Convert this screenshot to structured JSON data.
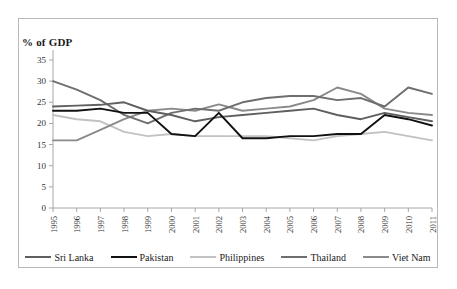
{
  "chart_data": {
    "type": "line",
    "title": "% of GDP",
    "xlabel": "",
    "ylabel": "",
    "ylim": [
      0,
      35
    ],
    "ytick_step": 5,
    "yticks": [
      "35",
      "30",
      "25",
      "20",
      "15",
      "10",
      "5",
      "0"
    ],
    "grid": false,
    "legend_position": "bottom",
    "categories": [
      "1995",
      "1996",
      "1997",
      "1998",
      "1999",
      "2000",
      "2001",
      "2002",
      "2003",
      "2004",
      "2005",
      "2006",
      "2007",
      "2008",
      "2009",
      "2010",
      "2011"
    ],
    "series": [
      {
        "name": "Sri Lanka",
        "color": "#5f5f5f",
        "values": [
          24.0,
          24.2,
          24.4,
          25.0,
          23.0,
          22.0,
          20.5,
          21.5,
          22.0,
          22.5,
          23.0,
          23.5,
          22.0,
          21.0,
          22.5,
          21.5,
          20.5
        ]
      },
      {
        "name": "Pakistan",
        "color": "#111111",
        "values": [
          23.0,
          23.0,
          23.5,
          22.5,
          22.5,
          17.5,
          17.0,
          22.5,
          16.5,
          16.5,
          17.0,
          17.0,
          17.5,
          17.5,
          22.0,
          21.0,
          19.5
        ]
      },
      {
        "name": "Philippines",
        "color": "#c2c2c2",
        "values": [
          22.0,
          21.0,
          20.5,
          18.0,
          17.0,
          17.5,
          17.0,
          17.0,
          17.0,
          17.0,
          16.5,
          16.0,
          17.0,
          17.5,
          18.0,
          17.0,
          16.0
        ]
      },
      {
        "name": "Thailand",
        "color": "#6e6e6e",
        "values": [
          30.0,
          28.0,
          25.5,
          22.0,
          20.0,
          22.5,
          23.5,
          23.0,
          25.0,
          26.0,
          26.5,
          26.5,
          25.5,
          26.0,
          24.0,
          28.5,
          27.0
        ]
      },
      {
        "name": "Viet Nam",
        "color": "#8a8a8a",
        "values": [
          16.0,
          16.0,
          18.5,
          21.0,
          23.0,
          23.5,
          23.0,
          24.5,
          23.0,
          23.5,
          24.0,
          25.5,
          28.5,
          27.0,
          23.5,
          22.5,
          22.0
        ]
      }
    ]
  },
  "legend": {
    "items": [
      {
        "label": "Sri Lanka"
      },
      {
        "label": "Pakistan"
      },
      {
        "label": "Philippines"
      },
      {
        "label": "Thailand"
      },
      {
        "label": "Viet Nam"
      }
    ]
  }
}
